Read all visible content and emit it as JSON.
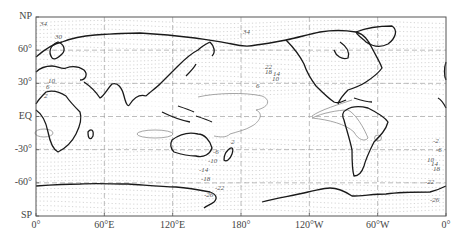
{
  "figure": {
    "type": "contour_map",
    "projection": "equirectangular",
    "caption_partial": "…",
    "frame": {
      "x0": 36,
      "y0": 17,
      "x1": 446,
      "y1": 216
    }
  },
  "axes": {
    "lat_labels": [
      {
        "text": "NP",
        "lat": 90
      },
      {
        "text": "60°",
        "lat": 60
      },
      {
        "text": "30°",
        "lat": 30
      },
      {
        "text": "EQ",
        "lat": 0
      },
      {
        "text": "-30°",
        "lat": -30
      },
      {
        "text": "-60°",
        "lat": -60
      },
      {
        "text": "SP",
        "lat": -90
      }
    ],
    "lon_labels": [
      {
        "text": "0°",
        "lon": 0
      },
      {
        "text": "60°E",
        "lon": 60
      },
      {
        "text": "120°E",
        "lon": 120
      },
      {
        "text": "180°",
        "lon": 180
      },
      {
        "text": "120°W",
        "lon": 240
      },
      {
        "text": "60°W",
        "lon": 300
      },
      {
        "text": "0°",
        "lon": 360
      }
    ]
  },
  "contour_labels": [
    {
      "text": "34",
      "x": 40,
      "y": 25
    },
    {
      "text": "30",
      "x": 55,
      "y": 38
    },
    {
      "text": "34",
      "x": 243,
      "y": 33
    },
    {
      "text": "22",
      "x": 265,
      "y": 68
    },
    {
      "text": "18",
      "x": 265,
      "y": 73
    },
    {
      "text": "14",
      "x": 273,
      "y": 75
    },
    {
      "text": "10",
      "x": 272,
      "y": 80
    },
    {
      "text": "6",
      "x": 256,
      "y": 87
    },
    {
      "text": "10",
      "x": 48,
      "y": 82
    },
    {
      "text": "6",
      "x": 46,
      "y": 88
    },
    {
      "text": "2",
      "x": 44,
      "y": 97
    },
    {
      "text": "2",
      "x": 231,
      "y": 143
    },
    {
      "text": "-6",
      "x": 213,
      "y": 153
    },
    {
      "text": "-10",
      "x": 208,
      "y": 162
    },
    {
      "text": "-14",
      "x": 199,
      "y": 171
    },
    {
      "text": "-18",
      "x": 201,
      "y": 180
    },
    {
      "text": "-22",
      "x": 215,
      "y": 189
    },
    {
      "text": "-26",
      "x": 204,
      "y": 196
    },
    {
      "text": "-2",
      "x": 433,
      "y": 142
    },
    {
      "text": "-6",
      "x": 436,
      "y": 151
    },
    {
      "text": "10",
      "x": 427,
      "y": 161
    },
    {
      "text": "14",
      "x": 431,
      "y": 165
    },
    {
      "text": "18",
      "x": 433,
      "y": 170
    },
    {
      "text": "-22",
      "x": 425,
      "y": 183
    },
    {
      "text": "-26",
      "x": 430,
      "y": 201
    }
  ],
  "colors": {
    "coast": "#1a1a1a",
    "grid": "#9a9a9a",
    "dotted_contour": "#b5b5b5",
    "zero_contour": "#8c8c8c",
    "frame": "#555555"
  }
}
